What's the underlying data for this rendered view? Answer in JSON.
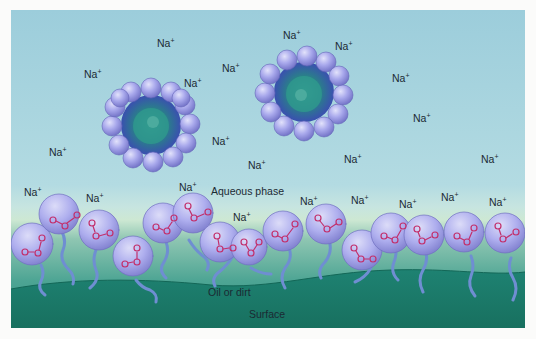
{
  "figure": {
    "labels": {
      "aqueous_phase": "Aqueous phase",
      "oil_or_dirt": "Oil or dirt",
      "surface": "Surface"
    },
    "ion": {
      "symbol": "Na",
      "charge": "+"
    },
    "na_positions": [
      [
        152,
        33
      ],
      [
        82,
        58
      ],
      [
        178,
        65
      ],
      [
        223,
        49
      ],
      [
        327,
        25
      ],
      [
        379,
        58
      ],
      [
        332,
        25
      ],
      [
        395,
        58
      ],
      [
        414,
        95
      ],
      [
        345,
        139
      ],
      [
        477,
        138
      ],
      [
        40,
        132
      ],
      [
        205,
        121
      ],
      [
        215,
        143
      ],
      [
        250,
        149
      ],
      [
        183,
        167
      ],
      [
        35,
        172
      ],
      [
        85,
        178
      ],
      [
        225,
        197
      ],
      [
        293,
        181
      ],
      [
        343,
        178
      ],
      [
        393,
        183
      ],
      [
        441,
        175
      ],
      [
        483,
        180
      ]
    ],
    "micelles": [
      {
        "cx": 140,
        "cy": 115,
        "r": 40
      },
      {
        "cx": 293,
        "cy": 82,
        "r": 40
      }
    ],
    "head_group": {
      "c": "C",
      "o": "O"
    },
    "colors": {
      "water_top": "#9fcfdc",
      "water_bottom": "#bfe0e4",
      "interface_band": "#cfe8d6",
      "oil_top": "#6fb6a4",
      "oil_bottom": "#2f8f80",
      "surface": "#1f7f70",
      "sphere": "#a8a8ec",
      "sphere_dark": "#6d6dc4",
      "core": "#2e8f88",
      "carboxylate": "#c4306e",
      "tail": "#6d8fd0"
    }
  }
}
